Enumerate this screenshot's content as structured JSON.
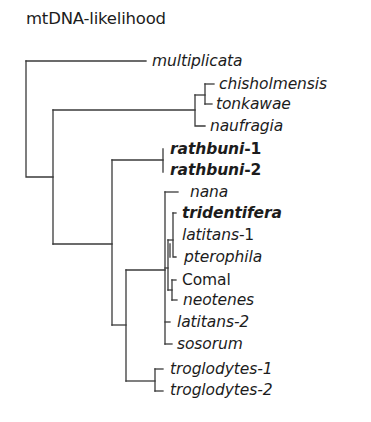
{
  "figure": {
    "title": "mtDNA-likelihood",
    "colors": {
      "branch": "#3a3a3a",
      "text": "#1c1c1c",
      "background": "#ffffff"
    }
  },
  "taxa": [
    {
      "id": "multiplicata",
      "name": "multiplicata",
      "suffix": "",
      "style": "italic"
    },
    {
      "id": "chisholmensis",
      "name": "chisholmensis",
      "suffix": "",
      "style": "italic"
    },
    {
      "id": "tonkawae",
      "name": "tonkawae",
      "suffix": "",
      "style": "italic"
    },
    {
      "id": "naufragia",
      "name": "naufragia",
      "suffix": "",
      "style": "italic"
    },
    {
      "id": "rathbuni-1",
      "name": "rathbuni",
      "suffix": "-1",
      "style": "bold-italic"
    },
    {
      "id": "rathbuni-2",
      "name": "rathbuni",
      "suffix": "-2",
      "style": "bold-italic"
    },
    {
      "id": "nana",
      "name": "nana",
      "suffix": "",
      "style": "italic"
    },
    {
      "id": "tridentifera",
      "name": "tridentifera",
      "suffix": "",
      "style": "bold-italic"
    },
    {
      "id": "latitans-1",
      "name": "latitans",
      "suffix": "-1",
      "style": "italic"
    },
    {
      "id": "pterophila",
      "name": "pterophila",
      "suffix": "",
      "style": "italic"
    },
    {
      "id": "comal",
      "name": "Comal",
      "suffix": "",
      "style": "roman"
    },
    {
      "id": "neotenes",
      "name": "neotenes",
      "suffix": "",
      "style": "italic"
    },
    {
      "id": "latitans-2",
      "name": "latitans",
      "suffix": "-2",
      "style": "italic"
    },
    {
      "id": "sosorum",
      "name": "sosorum",
      "suffix": "",
      "style": "italic"
    },
    {
      "id": "troglodytes-1",
      "name": "troglodytes",
      "suffix": "-1",
      "style": "italic"
    },
    {
      "id": "troglodytes-2",
      "name": "troglodytes",
      "suffix": "-2",
      "style": "italic"
    }
  ],
  "tree_newick": "(multiplicata,(((chisholmensis,tonkawae),naufragia),((rathbuni-1,rathbuni-2),((nana,((tridentifera,(latitans-1,pterophila)),(Comal,neotenes)),latitans-2,sosorum),(troglodytes-1,troglodytes-2)))));"
}
